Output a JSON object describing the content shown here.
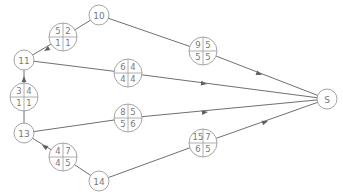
{
  "diagram": {
    "type": "network-graph",
    "nodes": [
      {
        "id": "10",
        "label": "10",
        "x": 99,
        "y": 15,
        "r": 10
      },
      {
        "id": "11",
        "label": "11",
        "x": 24,
        "y": 60,
        "r": 10
      },
      {
        "id": "13",
        "label": "13",
        "x": 24,
        "y": 133,
        "r": 10
      },
      {
        "id": "14",
        "label": "14",
        "x": 99,
        "y": 181,
        "r": 10
      },
      {
        "id": "S",
        "label": "S",
        "x": 327,
        "y": 99,
        "r": 10
      }
    ],
    "boxes": [
      {
        "id": "b-10-11",
        "x": 63,
        "y": 37,
        "r": 14,
        "cells": [
          "5",
          "2",
          "1",
          "1"
        ]
      },
      {
        "id": "b-13-11",
        "x": 24,
        "y": 97,
        "r": 14,
        "cells": [
          "3",
          "4",
          "1",
          "1"
        ]
      },
      {
        "id": "b-14-13",
        "x": 63,
        "y": 157,
        "r": 14,
        "cells": [
          "4",
          "7",
          "4",
          "5"
        ]
      },
      {
        "id": "b-11-S",
        "x": 128,
        "y": 73,
        "r": 14,
        "cells": [
          "6",
          "4",
          "4",
          "4"
        ]
      },
      {
        "id": "b-10-S",
        "x": 203,
        "y": 51,
        "r": 14,
        "cells": [
          "9",
          "5",
          "5",
          "5"
        ]
      },
      {
        "id": "b-13-S",
        "x": 128,
        "y": 118,
        "r": 14,
        "cells": [
          "8",
          "5",
          "5",
          "6"
        ]
      },
      {
        "id": "b-14-S",
        "x": 203,
        "y": 143,
        "r": 14,
        "cells": [
          "15",
          "7",
          "6",
          "5"
        ]
      }
    ],
    "edges": [
      {
        "from": "10",
        "to": "11",
        "via": "b-10-11",
        "arrow_at": [
          44,
          51
        ],
        "arrow_dir": "toward-to"
      },
      {
        "from": "13",
        "to": "11",
        "via": "b-13-11",
        "arrow_at": [
          24,
          76
        ],
        "arrow_dir": "toward-to"
      },
      {
        "from": "14",
        "to": "13",
        "via": "b-14-13",
        "arrow_at": [
          42,
          145
        ],
        "arrow_dir": "toward-to"
      },
      {
        "from": "11",
        "to": "S",
        "via": "b-11-S",
        "arrow_at": [
          207,
          84
        ],
        "arrow_dir": "toward-to"
      },
      {
        "from": "10",
        "to": "S",
        "via": "b-10-S",
        "arrow_at": [
          262,
          75
        ],
        "arrow_dir": "toward-to"
      },
      {
        "from": "13",
        "to": "S",
        "via": "b-13-S",
        "arrow_at": [
          208,
          112
        ],
        "arrow_dir": "toward-to"
      },
      {
        "from": "14",
        "to": "S",
        "via": "b-14-S",
        "arrow_at": [
          268,
          121
        ],
        "arrow_dir": "toward-to"
      }
    ]
  }
}
